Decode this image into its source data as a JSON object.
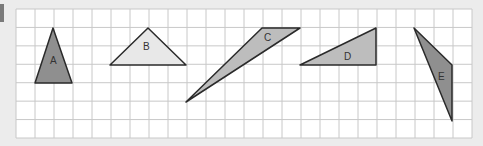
{
  "figure": {
    "grid": {
      "columns": 24,
      "rows": 7,
      "background": "#ffffff",
      "line_color": "#c8c8c8"
    },
    "shapes": [
      {
        "label": "A",
        "type": "triangle",
        "fill": "#8f8f8f"
      },
      {
        "label": "B",
        "type": "triangle",
        "fill": "#e8e8e8"
      },
      {
        "label": "C",
        "type": "triangle",
        "fill": "#bdbdbd"
      },
      {
        "label": "D",
        "type": "triangle",
        "fill": "#bdbdbd"
      },
      {
        "label": "E",
        "type": "triangle",
        "fill": "#8f8f8f"
      }
    ]
  }
}
